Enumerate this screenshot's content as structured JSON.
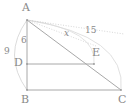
{
  "figure": {
    "background_color": "#ffffff",
    "stroke_color": "#a8a8a8",
    "text_color": "#8a8a8a",
    "vertices": [
      {
        "key": "A",
        "label": "A",
        "x": 27,
        "y": 20,
        "label_x": 22,
        "label_y": 2
      },
      {
        "key": "B",
        "label": "B",
        "x": 27,
        "y": 90,
        "label_x": 21,
        "label_y": 94
      },
      {
        "key": "C",
        "label": "C",
        "x": 121,
        "y": 90,
        "label_x": 118,
        "label_y": 94
      },
      {
        "key": "D",
        "label": "D",
        "x": 27,
        "y": 64,
        "label_x": 14,
        "label_y": 57
      },
      {
        "key": "E",
        "label": "E",
        "x": 94,
        "y": 64,
        "label_x": 92,
        "label_y": 47
      }
    ],
    "segments": [
      {
        "key": "AB",
        "from": "A",
        "to": "B",
        "style": "solid"
      },
      {
        "key": "BC",
        "from": "B",
        "to": "C",
        "style": "solid"
      },
      {
        "key": "AC",
        "from": "A",
        "to": "C",
        "style": "solid"
      },
      {
        "key": "DE",
        "from": "D",
        "to": "E",
        "style": "solid"
      }
    ],
    "arcs": [
      {
        "key": "arc-AB",
        "description": "faint arc bulging left from A to B"
      },
      {
        "key": "arc-AC",
        "description": "faint arc bulging right from A to C"
      },
      {
        "key": "arc-AE",
        "description": "faint arc from A toward E"
      }
    ],
    "dotted_rays": [
      {
        "key": "ray-A-right",
        "description": "dotted ray from A toward upper right"
      },
      {
        "key": "ray-A-E",
        "description": "dotted ray from A toward E"
      }
    ],
    "measures": [
      {
        "key": "AB",
        "label": "9",
        "x": 4,
        "y": 47,
        "italic": false
      },
      {
        "key": "AD",
        "label": "6",
        "x": 21,
        "y": 36,
        "italic": false
      },
      {
        "key": "AE",
        "label": "x",
        "x": 64,
        "y": 29,
        "italic": true
      },
      {
        "key": "AC",
        "label": "15",
        "x": 85,
        "y": 26,
        "italic": false
      }
    ]
  }
}
